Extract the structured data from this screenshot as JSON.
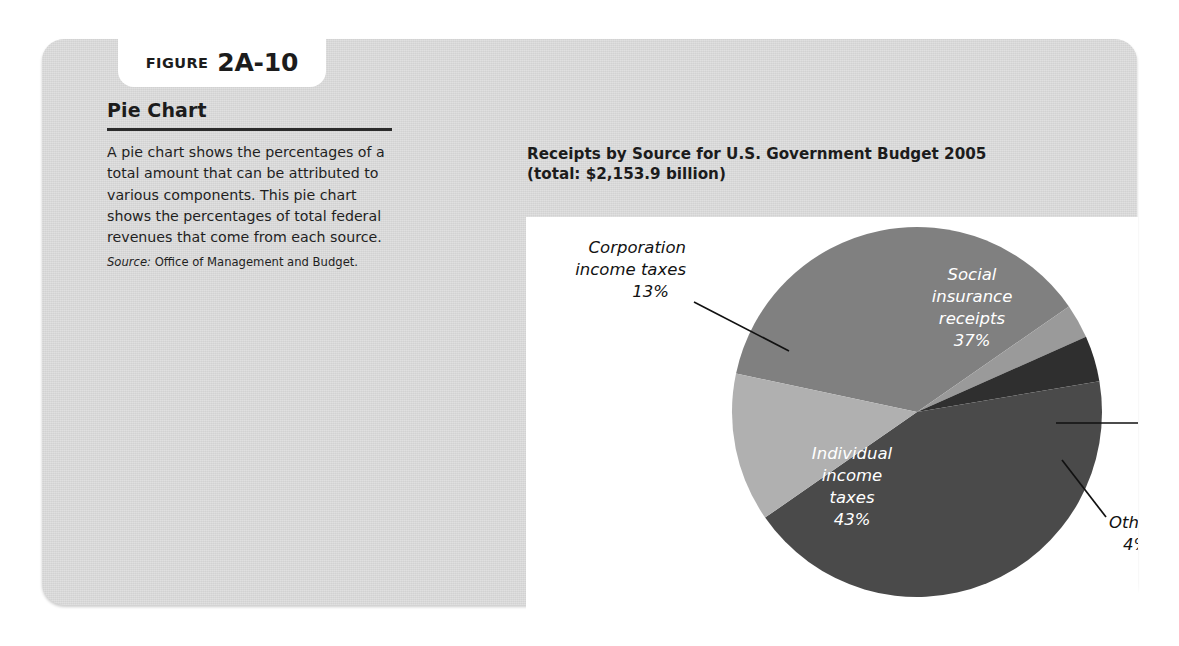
{
  "figure": {
    "label_word": "FIGURE",
    "number": "2A-10"
  },
  "panel": {
    "title": "Pie Chart",
    "body": "A pie chart shows the percentages of a total amount that can be attributed to various components. This pie chart shows the percentages of total federal revenues that come from each source.",
    "source_label": "Source:",
    "source_text": "Office of Management and Budget."
  },
  "chart": {
    "title_line1": "Receipts by Source for U.S. Government Budget 2005",
    "title_line2": "(total: $2,153.9 billion)"
  },
  "labels": {
    "corporation_l1": "Corporation",
    "corporation_l2": "income taxes",
    "corporation_pct": "13%",
    "social_l1": "Social",
    "social_l2": "insurance",
    "social_l3": "receipts",
    "social_pct": "37%",
    "individual_l1": "Individual",
    "individual_l2": "income",
    "individual_l3": "taxes",
    "individual_pct": "43%",
    "excise_l1": "Excise",
    "excise_l2": "taxes",
    "excise_pct": "3%",
    "other_l1": "Other",
    "other_pct": "4%"
  },
  "colors": {
    "panel_bg": "#d6d6d6",
    "plate_bg": "#ffffff",
    "individual": "#4a4a4a",
    "social": "#808080",
    "corporation": "#b0b0b0",
    "excise": "#9a9a9a",
    "other": "#2f2f2f",
    "text": "#1c1c1c"
  },
  "chart_data": {
    "type": "pie",
    "title": "Receipts by Source for U.S. Government Budget 2005 (total: $2,153.9 billion)",
    "total_label": "$2,153.9 billion",
    "total_value": 2153.9,
    "units": "billion USD",
    "unit_of_values": "percent of total receipts",
    "categories": [
      "Individual income taxes",
      "Social insurance receipts",
      "Corporation income taxes",
      "Other",
      "Excise taxes"
    ],
    "values": [
      43,
      37,
      13,
      4,
      3
    ],
    "slices": [
      {
        "label": "Individual income taxes",
        "value": 43,
        "display": "43%",
        "color": "#4a4a4a",
        "label_placement": "inside",
        "label_color": "#ffffff"
      },
      {
        "label": "Social insurance receipts",
        "value": 37,
        "display": "37%",
        "color": "#808080",
        "label_placement": "inside",
        "label_color": "#ffffff"
      },
      {
        "label": "Corporation income taxes",
        "value": 13,
        "display": "13%",
        "color": "#b0b0b0",
        "label_placement": "outside-left",
        "label_color": "#121212",
        "leader_line": true
      },
      {
        "label": "Other",
        "value": 4,
        "display": "4%",
        "color": "#2f2f2f",
        "label_placement": "outside-right",
        "label_color": "#121212",
        "leader_line": true
      },
      {
        "label": "Excise taxes",
        "value": 3,
        "display": "3%",
        "color": "#9a9a9a",
        "label_placement": "outside-right",
        "label_color": "#121212",
        "leader_line": true
      }
    ],
    "legend": "none",
    "grid": false,
    "xlabel": "",
    "ylabel": "",
    "source": "Office of Management and Budget."
  }
}
